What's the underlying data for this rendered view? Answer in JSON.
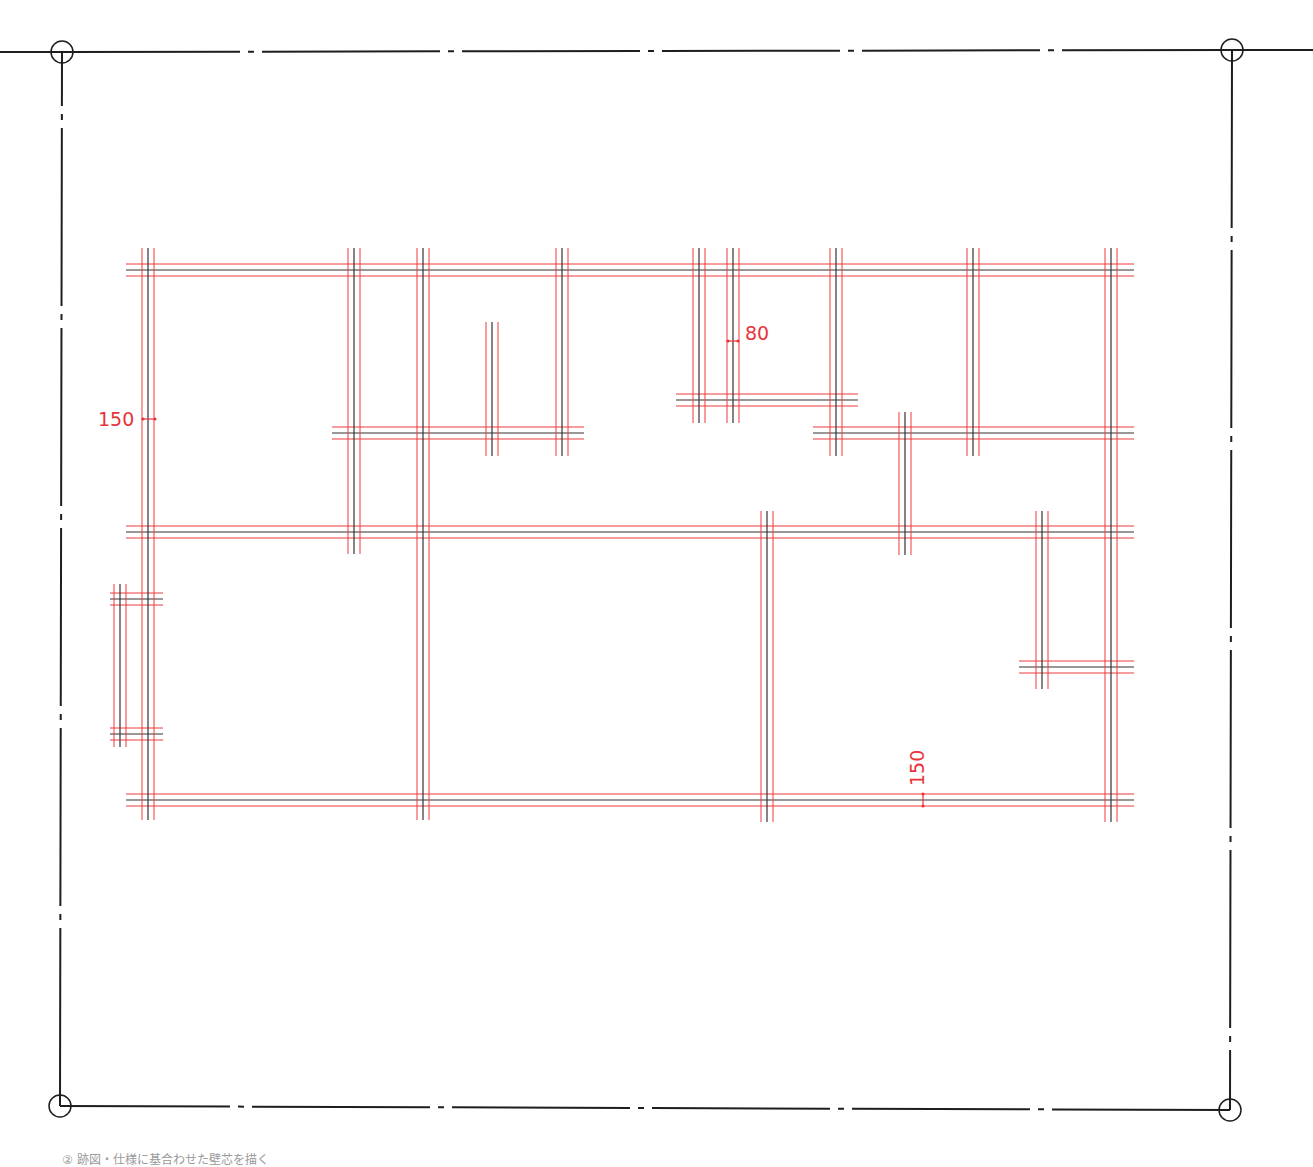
{
  "colors": {
    "boundary": "#1e1e1e",
    "centerline": "#333333",
    "wall_face": "#ee3a3a",
    "dimension": "#e8333a",
    "background": "#ffffff"
  },
  "boundary": {
    "corners": [
      {
        "name": "top-left",
        "x": 62,
        "y": 52
      },
      {
        "name": "top-right",
        "x": 1232,
        "y": 50
      },
      {
        "name": "bottom-right",
        "x": 1230,
        "y": 1110
      },
      {
        "name": "bottom-left",
        "x": 60,
        "y": 1106
      }
    ],
    "marker_radius": 11,
    "line_style": "dash-dot"
  },
  "wall_offset": 6,
  "walls": {
    "horizontal": [
      {
        "y": 270,
        "x1": 126,
        "x2": 1134
      },
      {
        "y": 433,
        "x1": 332,
        "x2": 584
      },
      {
        "y": 400,
        "x1": 676,
        "x2": 858
      },
      {
        "y": 433,
        "x1": 813,
        "x2": 1134
      },
      {
        "y": 532,
        "x1": 126,
        "x2": 1134
      },
      {
        "y": 599,
        "x1": 110,
        "x2": 163
      },
      {
        "y": 734,
        "x1": 110,
        "x2": 163
      },
      {
        "y": 667,
        "x1": 1019,
        "x2": 1134
      },
      {
        "y": 800,
        "x1": 126,
        "x2": 1134
      }
    ],
    "vertical": [
      {
        "x": 148,
        "y1": 248,
        "y2": 820
      },
      {
        "x": 120,
        "y1": 584,
        "y2": 747
      },
      {
        "x": 354,
        "y1": 248,
        "y2": 554
      },
      {
        "x": 423,
        "y1": 248,
        "y2": 820
      },
      {
        "x": 492,
        "y1": 322,
        "y2": 456
      },
      {
        "x": 562,
        "y1": 248,
        "y2": 456
      },
      {
        "x": 699,
        "y1": 248,
        "y2": 423
      },
      {
        "x": 733,
        "y1": 248,
        "y2": 423
      },
      {
        "x": 836,
        "y1": 248,
        "y2": 456
      },
      {
        "x": 905,
        "y1": 412,
        "y2": 555
      },
      {
        "x": 973,
        "y1": 248,
        "y2": 456
      },
      {
        "x": 767,
        "y1": 511,
        "y2": 822
      },
      {
        "x": 1042,
        "y1": 511,
        "y2": 689
      },
      {
        "x": 1111,
        "y1": 248,
        "y2": 822
      }
    ]
  },
  "dimensions": [
    {
      "label": "150",
      "orientation": "horizontal",
      "x": 143,
      "y": 419,
      "span": 12,
      "text_x": 98,
      "text_y": 426,
      "rotate": false
    },
    {
      "label": "80",
      "orientation": "horizontal",
      "x": 728,
      "y": 341,
      "span": 10,
      "text_x": 745,
      "text_y": 340,
      "rotate": false
    },
    {
      "label": "150",
      "orientation": "vertical",
      "x": 923,
      "y": 794,
      "span": 12,
      "text_x": 924,
      "text_y": 786,
      "rotate": true
    }
  ],
  "caption": "② 跡図・仕様に基合わせた壁芯を描く"
}
